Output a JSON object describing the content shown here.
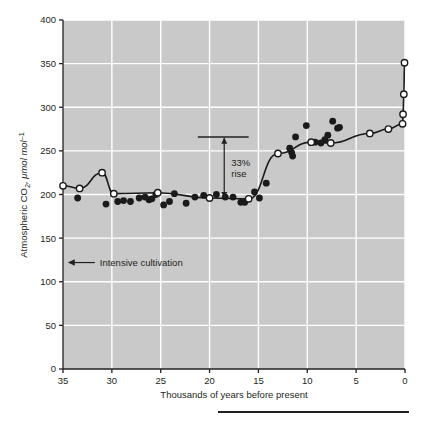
{
  "chart_data": {
    "type": "line",
    "title": "",
    "xlabel": "Thousands of years before present",
    "ylabel": "Atmospheric CO₂, μmol mol⁻¹",
    "xlim": [
      35,
      0
    ],
    "ylim": [
      0,
      400
    ],
    "x_reversed": true,
    "grid": true,
    "grid_color": "#ffffff",
    "plot_background": "#c9c9c9",
    "legend": null,
    "xticks": [
      35,
      30,
      25,
      20,
      15,
      10,
      5,
      0
    ],
    "xtick_labels": [
      "35",
      "30",
      "25",
      "20",
      "15",
      "10",
      "5",
      "0"
    ],
    "yticks": [
      0,
      50,
      100,
      150,
      200,
      250,
      300,
      350,
      400
    ],
    "ytick_labels": [
      "0",
      "50",
      "100",
      "150",
      "200",
      "250",
      "300",
      "350",
      "400"
    ],
    "series": [
      {
        "name": "smoothed-record-open-circles",
        "marker": "open-circle",
        "marker_fill": "#ffffff",
        "marker_stroke": "#1a1a1a",
        "line": true,
        "line_color": "#1a1a1a",
        "points": [
          {
            "x": 35.0,
            "y": 210
          },
          {
            "x": 33.3,
            "y": 207
          },
          {
            "x": 31.0,
            "y": 225
          },
          {
            "x": 29.8,
            "y": 201
          },
          {
            "x": 25.3,
            "y": 202
          },
          {
            "x": 20.0,
            "y": 196
          },
          {
            "x": 16.0,
            "y": 195
          },
          {
            "x": 13.0,
            "y": 247
          },
          {
            "x": 9.6,
            "y": 260
          },
          {
            "x": 7.6,
            "y": 259
          },
          {
            "x": 3.6,
            "y": 270
          },
          {
            "x": 1.7,
            "y": 275
          },
          {
            "x": 0.25,
            "y": 281
          },
          {
            "x": 0.2,
            "y": 292
          },
          {
            "x": 0.12,
            "y": 315
          },
          {
            "x": 0.05,
            "y": 351
          }
        ]
      },
      {
        "name": "individual-ice-core-measurements",
        "marker": "filled-circle",
        "marker_fill": "#1a1a1a",
        "line": false,
        "points": [
          {
            "x": 33.5,
            "y": 196
          },
          {
            "x": 30.6,
            "y": 189
          },
          {
            "x": 29.4,
            "y": 192
          },
          {
            "x": 28.8,
            "y": 193
          },
          {
            "x": 28.1,
            "y": 192
          },
          {
            "x": 27.2,
            "y": 196
          },
          {
            "x": 26.6,
            "y": 197
          },
          {
            "x": 26.2,
            "y": 194
          },
          {
            "x": 25.9,
            "y": 195
          },
          {
            "x": 25.5,
            "y": 200
          },
          {
            "x": 24.7,
            "y": 188
          },
          {
            "x": 24.1,
            "y": 192
          },
          {
            "x": 23.6,
            "y": 201
          },
          {
            "x": 22.4,
            "y": 190
          },
          {
            "x": 21.5,
            "y": 197
          },
          {
            "x": 20.6,
            "y": 199
          },
          {
            "x": 19.3,
            "y": 200
          },
          {
            "x": 18.4,
            "y": 197
          },
          {
            "x": 17.6,
            "y": 197
          },
          {
            "x": 16.8,
            "y": 191
          },
          {
            "x": 16.4,
            "y": 191
          },
          {
            "x": 14.9,
            "y": 196
          },
          {
            "x": 14.2,
            "y": 213
          },
          {
            "x": 15.4,
            "y": 203
          },
          {
            "x": 11.6,
            "y": 248
          },
          {
            "x": 11.5,
            "y": 244
          },
          {
            "x": 11.8,
            "y": 253
          },
          {
            "x": 11.2,
            "y": 266
          },
          {
            "x": 10.1,
            "y": 279
          },
          {
            "x": 9.2,
            "y": 260
          },
          {
            "x": 8.6,
            "y": 259
          },
          {
            "x": 8.2,
            "y": 263
          },
          {
            "x": 7.9,
            "y": 268
          },
          {
            "x": 7.4,
            "y": 284
          },
          {
            "x": 6.7,
            "y": 277
          },
          {
            "x": 6.9,
            "y": 276
          }
        ]
      }
    ],
    "annotations": [
      {
        "name": "rise-annotation",
        "text": "33%\nrise",
        "line1": "33%",
        "line2": "rise",
        "arrow": "double-headed-vertical",
        "x": 18.5,
        "y_top": 265,
        "y_bottom": 196,
        "bar_from_x": 21.2,
        "bar_to_x": 16.0,
        "bar_y": 266
      },
      {
        "name": "intensive-cultivation-annotation",
        "text": "Intensive cultivation",
        "arrow": "left",
        "x": 34.0,
        "y": 122
      }
    ]
  },
  "footer": {
    "rule_name": "bottom-rule"
  }
}
